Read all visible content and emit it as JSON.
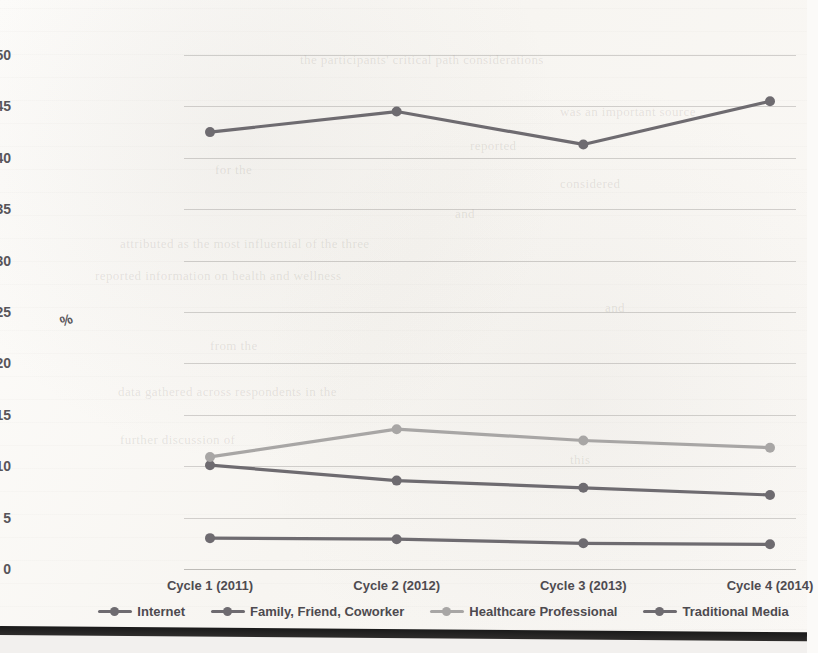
{
  "chart_data": {
    "type": "line",
    "title": "",
    "xlabel": "",
    "ylabel": "%",
    "categories": [
      "Cycle 1 (2011)",
      "Cycle 2 (2012)",
      "Cycle 3 (2013)",
      "Cycle 4 (2014)"
    ],
    "ylim": [
      0,
      50
    ],
    "yticks": [
      0,
      5,
      10,
      15,
      20,
      25,
      30,
      35,
      40,
      45,
      50
    ],
    "grid": true,
    "legend_position": "bottom",
    "series": [
      {
        "name": "Internet",
        "values": [
          42.5,
          44.5,
          41.3,
          45.5
        ],
        "color": "#6e6b70"
      },
      {
        "name": "Family, Friend, Coworker",
        "values": [
          10.1,
          8.6,
          7.9,
          7.2
        ],
        "color": "#6e6b70"
      },
      {
        "name": "Healthcare Professional",
        "values": [
          10.9,
          13.6,
          12.5,
          11.8
        ],
        "color": "#a8a6a5"
      },
      {
        "name": "Traditional Media",
        "values": [
          3.0,
          2.9,
          2.5,
          2.4
        ],
        "color": "#6e6b70"
      }
    ]
  },
  "axis": {
    "y_title": "%",
    "y_tick_labels": [
      "50",
      "45",
      "40",
      "35",
      "30",
      "25",
      "20",
      "15",
      "10",
      "5",
      "0"
    ],
    "x_tick_labels": [
      "Cycle 1 (2011)",
      "Cycle 2 (2012)",
      "Cycle 3 (2013)",
      "Cycle 4 (2014)"
    ]
  },
  "legend": {
    "items": [
      {
        "label": "Internet",
        "color": "#6e6b70"
      },
      {
        "label": "Family, Friend, Coworker",
        "color": "#6e6b70"
      },
      {
        "label": "Healthcare Professional",
        "color": "#a8a6a5"
      },
      {
        "label": "Traditional Media",
        "color": "#6e6b70"
      }
    ]
  },
  "page_bleed": {
    "lines": [
      {
        "text": "the participants' critical path considerations",
        "x": 300,
        "y": 52,
        "size": 13
      },
      {
        "text": "was an important source",
        "x": 560,
        "y": 104,
        "size": 13
      },
      {
        "text": "reported",
        "x": 470,
        "y": 138,
        "size": 13
      },
      {
        "text": "for the",
        "x": 215,
        "y": 162,
        "size": 13
      },
      {
        "text": "considered",
        "x": 560,
        "y": 176,
        "size": 13
      },
      {
        "text": "and",
        "x": 455,
        "y": 206,
        "size": 13
      },
      {
        "text": "attributed as the most influential of the three",
        "x": 120,
        "y": 236,
        "size": 13
      },
      {
        "text": "reported information on health and wellness",
        "x": 95,
        "y": 268,
        "size": 13
      },
      {
        "text": "and",
        "x": 605,
        "y": 300,
        "size": 13
      },
      {
        "text": "from the",
        "x": 210,
        "y": 338,
        "size": 13
      },
      {
        "text": "data gathered across respondents in the",
        "x": 118,
        "y": 384,
        "size": 13
      },
      {
        "text": "further discussion of",
        "x": 120,
        "y": 432,
        "size": 13
      },
      {
        "text": "this",
        "x": 570,
        "y": 452,
        "size": 13
      }
    ]
  }
}
